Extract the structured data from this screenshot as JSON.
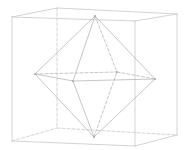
{
  "figure": {
    "title": "",
    "colors": {
      "cube_edge": "#c8c8c8",
      "octahedron_edge": "#b8b8b8",
      "vertex": "#a8a8a8",
      "background": "#ffffff"
    }
  },
  "cube": {
    "vertices": {
      "ftl": [
        12,
        17
      ],
      "btl": [
        57,
        8
      ],
      "btr": [
        177,
        14
      ],
      "ftr": [
        135,
        21
      ],
      "fbl": [
        12,
        141
      ],
      "bbl": [
        57,
        128
      ],
      "bbr": [
        177,
        135
      ],
      "fbr": [
        135,
        146
      ]
    },
    "edges": [
      {
        "from": "ftl",
        "to": "btl",
        "style": "solid"
      },
      {
        "from": "btl",
        "to": "btr",
        "style": "solid"
      },
      {
        "from": "btr",
        "to": "ftr",
        "style": "solid"
      },
      {
        "from": "ftr",
        "to": "ftl",
        "style": "solid"
      },
      {
        "from": "ftl",
        "to": "fbl",
        "style": "solid"
      },
      {
        "from": "ftr",
        "to": "fbr",
        "style": "solid"
      },
      {
        "from": "btr",
        "to": "bbr",
        "style": "solid"
      },
      {
        "from": "fbl",
        "to": "fbr",
        "style": "solid"
      },
      {
        "from": "fbr",
        "to": "bbr",
        "style": "solid"
      },
      {
        "from": "btl",
        "to": "bbl",
        "style": "dashed"
      },
      {
        "from": "fbl",
        "to": "bbl",
        "style": "dashed"
      },
      {
        "from": "bbl",
        "to": "bbr",
        "style": "dashed"
      }
    ]
  },
  "octahedron": {
    "vertices": {
      "top": [
        95,
        16
      ],
      "bottom": [
        94,
        137
      ],
      "left": [
        35,
        74
      ],
      "right": [
        155,
        79
      ],
      "front": [
        73,
        81
      ],
      "back": [
        117,
        72
      ]
    },
    "edges": [
      {
        "from": "top",
        "to": "left",
        "style": "solid"
      },
      {
        "from": "top",
        "to": "right",
        "style": "solid"
      },
      {
        "from": "top",
        "to": "front",
        "style": "solid"
      },
      {
        "from": "top",
        "to": "back",
        "style": "dashed"
      },
      {
        "from": "bottom",
        "to": "left",
        "style": "solid"
      },
      {
        "from": "bottom",
        "to": "right",
        "style": "solid"
      },
      {
        "from": "bottom",
        "to": "front",
        "style": "solid"
      },
      {
        "from": "bottom",
        "to": "back",
        "style": "dashed"
      },
      {
        "from": "left",
        "to": "front",
        "style": "solid"
      },
      {
        "from": "front",
        "to": "right",
        "style": "solid"
      },
      {
        "from": "left",
        "to": "back",
        "style": "dashed"
      },
      {
        "from": "back",
        "to": "right",
        "style": "dashed"
      }
    ]
  }
}
